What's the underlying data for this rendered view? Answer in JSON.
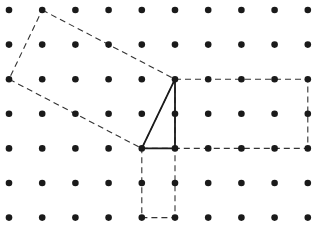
{
  "diagram": {
    "type": "dot-grid-geometry",
    "grid": {
      "columns": 10,
      "rows": 7,
      "origin_x": 9,
      "origin_y": 10,
      "spacing_x": 33.2,
      "spacing_y": 34.6,
      "dot_radius": 3.3,
      "dot_color": "#1a1a1a"
    },
    "shapes": [
      {
        "name": "tilted-square-on-hypotenuse",
        "style": "dashed",
        "color": "#333333",
        "points": [
          [
            1,
            0
          ],
          [
            5,
            2
          ],
          [
            4,
            4
          ],
          [
            0,
            2
          ]
        ]
      },
      {
        "name": "rectangle-on-vertical-side",
        "style": "dashed",
        "color": "#333333",
        "points": [
          [
            5,
            2
          ],
          [
            9,
            2
          ],
          [
            9,
            4
          ],
          [
            5,
            4
          ]
        ]
      },
      {
        "name": "rectangle-on-horizontal-side",
        "style": "dashed",
        "color": "#333333",
        "points": [
          [
            4,
            4
          ],
          [
            5,
            4
          ],
          [
            5,
            6
          ],
          [
            4,
            6
          ]
        ]
      },
      {
        "name": "right-triangle",
        "style": "solid",
        "color": "#1a1a1a",
        "points": [
          [
            4,
            4
          ],
          [
            5,
            4
          ],
          [
            5,
            2
          ]
        ]
      }
    ]
  }
}
